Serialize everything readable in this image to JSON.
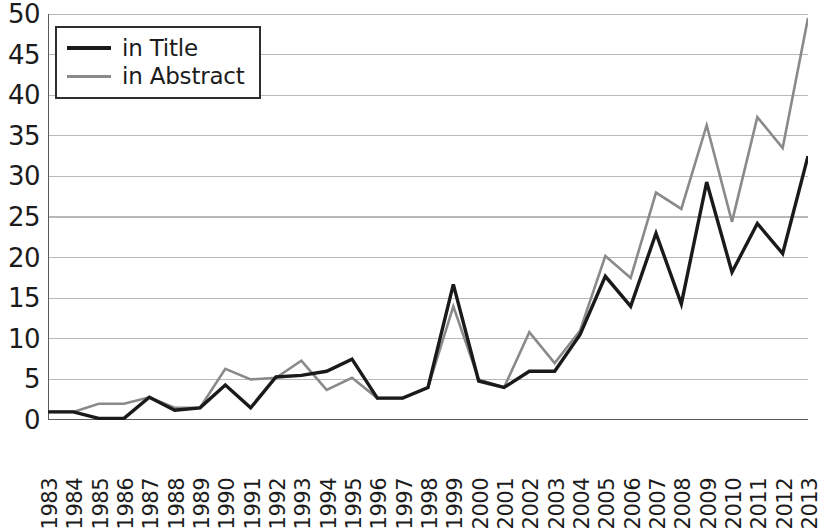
{
  "chart_data": {
    "type": "line",
    "title": "",
    "xlabel": "",
    "ylabel": "",
    "ylim": [
      0,
      50
    ],
    "ytick_step": 5,
    "ytick_labels": [
      "50",
      "45",
      "40",
      "35",
      "30",
      "25",
      "20",
      "15",
      "10",
      "5",
      "0"
    ],
    "grid": true,
    "legend_position": "top-left",
    "categories": [
      "1983",
      "1984",
      "1985",
      "1986",
      "1987",
      "1988",
      "1989",
      "1990",
      "1991",
      "1992",
      "1993",
      "1994",
      "1995",
      "1996",
      "1997",
      "1998",
      "1999",
      "2000",
      "2001",
      "2002",
      "2003",
      "2004",
      "2005",
      "2006",
      "2007",
      "2008",
      "2009",
      "2010",
      "2011",
      "2012",
      "2013"
    ],
    "series": [
      {
        "name": "in Title",
        "color": "#1a1a1a",
        "width": 3.4,
        "values": [
          1,
          1,
          0.2,
          0.2,
          2.8,
          1.2,
          1.5,
          4.3,
          1.5,
          5.3,
          5.5,
          6,
          7.5,
          2.7,
          2.7,
          4,
          16.7,
          4.8,
          4,
          6,
          6,
          10.5,
          17.7,
          14,
          23,
          14.3,
          29.3,
          18.2,
          24.2,
          20.5,
          32.5
        ]
      },
      {
        "name": "in Abstract",
        "color": "#8a8a8a",
        "width": 2.6,
        "values": [
          1,
          1,
          2,
          2,
          2.8,
          1.5,
          1.5,
          6.3,
          5,
          5.2,
          7.3,
          3.7,
          5.2,
          2.7,
          2.7,
          4,
          14,
          5,
          4,
          10.8,
          7,
          11,
          20.2,
          17.5,
          28,
          26,
          36.3,
          24.4,
          37.3,
          33.5,
          49.5
        ]
      }
    ]
  },
  "legend": {
    "items": [
      {
        "label": "in Title"
      },
      {
        "label": "in Abstract"
      }
    ]
  },
  "colors": {
    "series_title": "#1a1a1a",
    "series_abstract": "#8a8a8a",
    "gridline": "#b8b8b8",
    "axis": "#5a5a5a",
    "background": "#ffffff"
  }
}
